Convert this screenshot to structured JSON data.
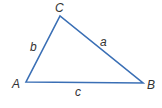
{
  "diagram": {
    "type": "triangle",
    "line_color": "#3a6fb5",
    "label_color": "#333333",
    "vertices": {
      "A": {
        "label": "A",
        "x": 26,
        "y": 82
      },
      "B": {
        "label": "B",
        "x": 143,
        "y": 83
      },
      "C": {
        "label": "C",
        "x": 60,
        "y": 16
      }
    },
    "sides": {
      "a": {
        "label": "a",
        "from": "B",
        "to": "C"
      },
      "b": {
        "label": "b",
        "from": "A",
        "to": "C"
      },
      "c": {
        "label": "c",
        "from": "A",
        "to": "B"
      }
    }
  }
}
